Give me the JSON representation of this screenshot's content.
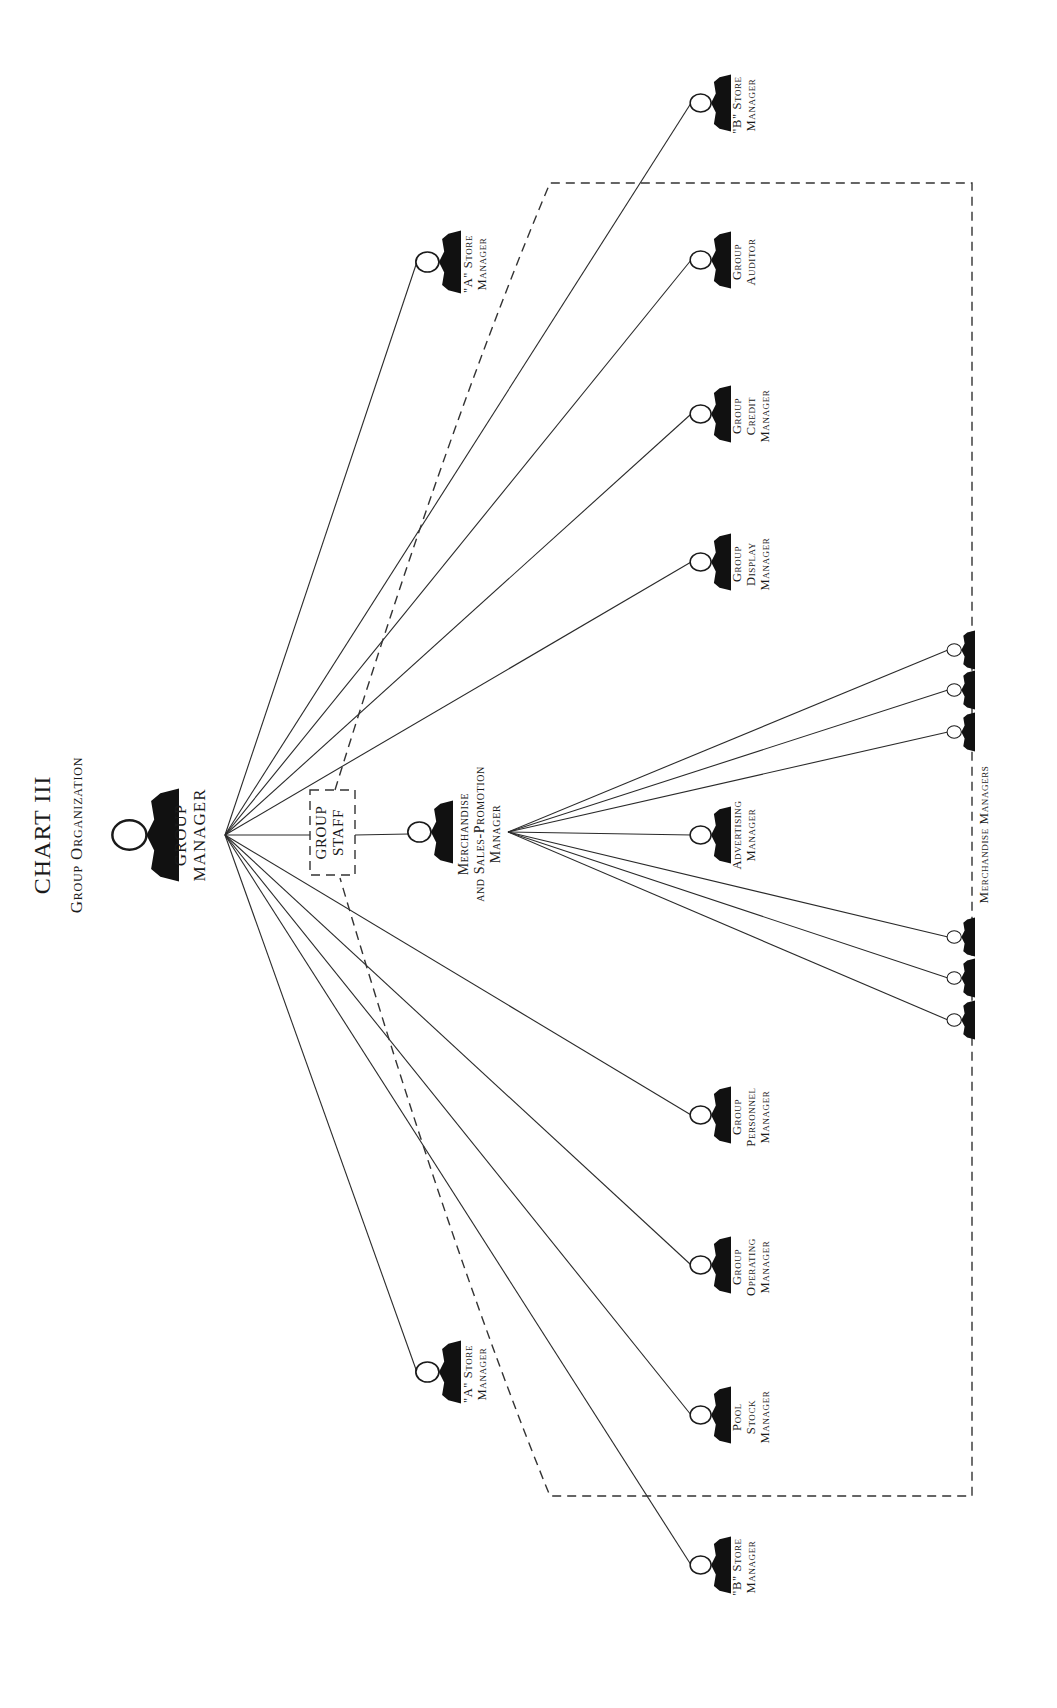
{
  "chart": {
    "title": "CHART III",
    "subtitle": "Group Organization"
  },
  "colors": {
    "ink": "#111111",
    "paper": "#ffffff"
  },
  "group_manager": {
    "label_lines": [
      "GROUP",
      "MANAGER"
    ],
    "hub": [
      225,
      835
    ],
    "figure": {
      "x": 148,
      "y": 835,
      "scale": 1.55
    }
  },
  "group_staff": {
    "label_lines": [
      "GROUP",
      "STAFF"
    ],
    "box": {
      "x": 310,
      "y": 790,
      "w": 45,
      "h": 85
    }
  },
  "msp_manager": {
    "label_lines": [
      "Merchandise",
      "and Sales-Promotion",
      "Manager"
    ],
    "figure": {
      "x": 432,
      "y": 832,
      "scale": 1.05
    },
    "hub": [
      508,
      832
    ]
  },
  "staff_boundary": {
    "x1": 550,
    "y1": 183,
    "x2": 995,
    "y2": 1496,
    "apex_top": [
      335,
      790
    ],
    "apex_bottom": [
      340,
      878
    ]
  },
  "direct_reports": [
    {
      "id": "b-store-top",
      "label_lines": [
        "\"B\" Store",
        "Manager"
      ],
      "x": 712,
      "y": 103,
      "scale": 0.95
    },
    {
      "id": "a-store-top",
      "label_lines": [
        "\"A\" Store",
        "Manager"
      ],
      "x": 440,
      "y": 262,
      "scale": 1.05
    },
    {
      "id": "group-auditor",
      "label_lines": [
        "Group",
        "Auditor"
      ],
      "x": 712,
      "y": 260,
      "scale": 0.95
    },
    {
      "id": "group-credit-manager",
      "label_lines": [
        "Group",
        "Credit",
        "Manager"
      ],
      "x": 712,
      "y": 414,
      "scale": 0.95
    },
    {
      "id": "group-display-manager",
      "label_lines": [
        "Group",
        "Display",
        "Manager"
      ],
      "x": 712,
      "y": 562,
      "scale": 0.95
    },
    {
      "id": "group-personnel-manager",
      "label_lines": [
        "Group",
        "Personnel",
        "Manager"
      ],
      "x": 712,
      "y": 1115,
      "scale": 0.95
    },
    {
      "id": "group-operating-manager",
      "label_lines": [
        "Group",
        "Operating",
        "Manager"
      ],
      "x": 712,
      "y": 1265,
      "scale": 0.95
    },
    {
      "id": "a-store-bottom",
      "label_lines": [
        "\"A\" Store",
        "Manager"
      ],
      "x": 440,
      "y": 1372,
      "scale": 1.05
    },
    {
      "id": "pool-stock-manager",
      "label_lines": [
        "Pool",
        "Stock",
        "Manager"
      ],
      "x": 712,
      "y": 1415,
      "scale": 0.95
    },
    {
      "id": "b-store-bottom",
      "label_lines": [
        "\"B\" Store",
        "Manager"
      ],
      "x": 712,
      "y": 1565,
      "scale": 0.95
    }
  ],
  "msp_reports": {
    "advertising": {
      "label_lines": [
        "Advertising",
        "Manager"
      ],
      "x": 712,
      "y": 835,
      "scale": 0.95
    },
    "merchandise_managers_label": "Merchandise Managers",
    "merchandise_managers": [
      {
        "x": 962,
        "y": 650
      },
      {
        "x": 962,
        "y": 690
      },
      {
        "x": 962,
        "y": 732
      },
      {
        "x": 962,
        "y": 937
      },
      {
        "x": 962,
        "y": 978
      },
      {
        "x": 962,
        "y": 1020
      }
    ]
  }
}
